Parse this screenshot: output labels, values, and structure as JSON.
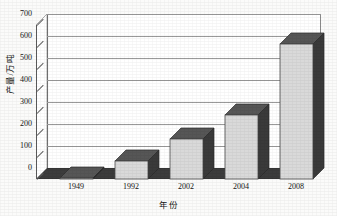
{
  "chart_data": {
    "type": "bar",
    "title": "",
    "subtitle": "",
    "xlabel": "年份",
    "ylabel": "产量/万吨",
    "categories": [
      "1949",
      "1992",
      "2002",
      "2004",
      "2008"
    ],
    "values": [
      0,
      80,
      180,
      290,
      615
    ],
    "series": [
      {
        "name": "产量",
        "values": [
          0,
          80,
          180,
          290,
          615
        ]
      }
    ],
    "ylim": [
      0,
      700
    ],
    "ytick_labels": [
      "0",
      "100",
      "200",
      "300",
      "400",
      "500",
      "600",
      "700"
    ],
    "ytick_values": [
      0,
      100,
      200,
      300,
      400,
      500,
      600,
      700
    ],
    "grid": true,
    "legend": false,
    "legend_position": "none",
    "style": "3d-column",
    "annotations": []
  },
  "colors": {
    "bar_front": "#d9d9d9",
    "bar_side": "#3a3a3a",
    "bar_top": "#565656",
    "floor": "#3c3c3c",
    "plot_background": "#ffffff",
    "gridline": "#9a9a9a",
    "axis": "#5c5c5c",
    "text": "#141414",
    "page_background": "#fbfbfa"
  }
}
